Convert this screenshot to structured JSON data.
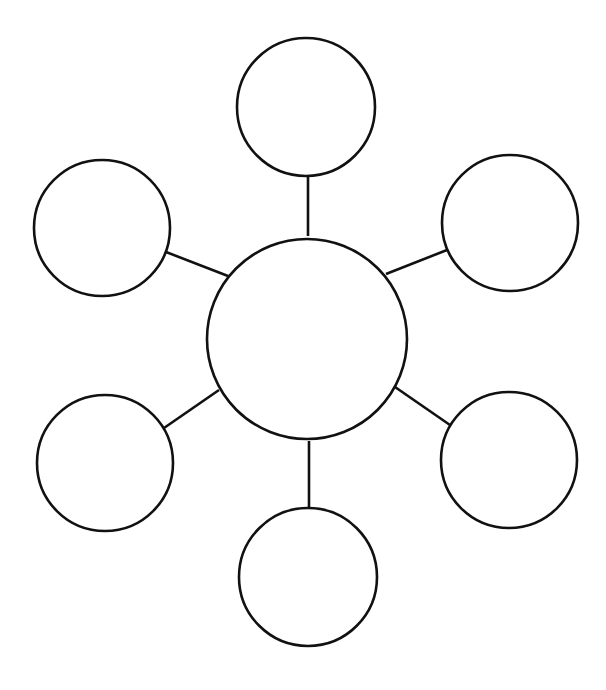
{
  "diagram": {
    "type": "bubble-map",
    "width": 606,
    "height": 690,
    "background": "#ffffff",
    "stroke_color": "#111111",
    "center": {
      "id": "center",
      "label": "",
      "cx": 307,
      "cy": 339,
      "r": 100
    },
    "nodes": [
      {
        "id": "top",
        "label": "",
        "cx": 306,
        "cy": 107,
        "r": 69
      },
      {
        "id": "top-left",
        "label": "",
        "cx": 102,
        "cy": 228,
        "r": 68
      },
      {
        "id": "top-right",
        "label": "",
        "cx": 510,
        "cy": 223,
        "r": 68
      },
      {
        "id": "bottom-left",
        "label": "",
        "cx": 105,
        "cy": 463,
        "r": 68
      },
      {
        "id": "bottom-right",
        "label": "",
        "cx": 509,
        "cy": 460,
        "r": 68
      },
      {
        "id": "bottom",
        "label": "",
        "cx": 308,
        "cy": 577,
        "r": 69
      }
    ],
    "edges": [
      {
        "from": "center",
        "to": "top",
        "x1": 308,
        "y1": 236,
        "x2": 308,
        "y2": 177
      },
      {
        "from": "center",
        "to": "top-left",
        "x1": 228,
        "y1": 276,
        "x2": 166,
        "y2": 252
      },
      {
        "from": "center",
        "to": "top-right",
        "x1": 386,
        "y1": 274,
        "x2": 447,
        "y2": 250
      },
      {
        "from": "center",
        "to": "bottom-left",
        "x1": 219,
        "y1": 390,
        "x2": 164,
        "y2": 428
      },
      {
        "from": "center",
        "to": "bottom-right",
        "x1": 395,
        "y1": 387,
        "x2": 450,
        "y2": 425
      },
      {
        "from": "center",
        "to": "bottom",
        "x1": 309,
        "y1": 441,
        "x2": 309,
        "y2": 508
      }
    ]
  }
}
